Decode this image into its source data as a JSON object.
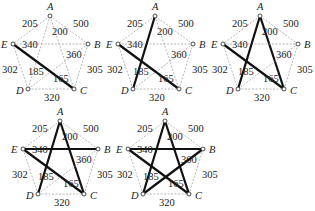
{
  "nodes": {
    "A": {
      "x": 50,
      "y": 16
    },
    "B": {
      "x": 88,
      "y": 44
    },
    "C": {
      "x": 74,
      "y": 89
    },
    "D": {
      "x": 28,
      "y": 89
    },
    "E": {
      "x": 13,
      "y": 44
    }
  },
  "edges": [
    {
      "id": "AE",
      "from": "A",
      "to": "E",
      "weight": "205",
      "lx": 22,
      "ly": 27
    },
    {
      "id": "AB",
      "from": "A",
      "to": "B",
      "weight": "500",
      "lx": 73,
      "ly": 27
    },
    {
      "id": "AC",
      "from": "A",
      "to": "C",
      "weight": "200",
      "lx": 52,
      "ly": 35
    },
    {
      "id": "EB",
      "from": "E",
      "to": "B",
      "weight": "340",
      "lx": 22,
      "ly": 48
    },
    {
      "id": "DB",
      "from": "D",
      "to": "B",
      "weight": "360",
      "lx": 66,
      "ly": 58
    },
    {
      "id": "ED",
      "from": "E",
      "to": "D",
      "weight": "302",
      "lx": 2,
      "ly": 73
    },
    {
      "id": "AD",
      "from": "A",
      "to": "D",
      "weight": "185",
      "lx": 28,
      "ly": 75
    },
    {
      "id": "EC",
      "from": "E",
      "to": "C",
      "weight": "165",
      "lx": 53,
      "ly": 82
    },
    {
      "id": "BC",
      "from": "B",
      "to": "C",
      "weight": "305",
      "lx": 87,
      "ly": 73
    },
    {
      "id": "DC",
      "from": "D",
      "to": "C",
      "weight": "320",
      "lx": 44,
      "ly": 101
    }
  ],
  "panels": [
    {
      "index": 1,
      "x": 0,
      "y": 0,
      "heavy_edges": [
        "EC"
      ]
    },
    {
      "index": 2,
      "x": 105,
      "y": 0,
      "heavy_edges": [
        "EC",
        "AD"
      ]
    },
    {
      "index": 3,
      "x": 210,
      "y": 0,
      "heavy_edges": [
        "EC",
        "AD",
        "AC"
      ]
    },
    {
      "index": 4,
      "x": 10,
      "y": 105,
      "heavy_edges": [
        "EC",
        "AD",
        "AC",
        "EB"
      ]
    },
    {
      "index": 5,
      "x": 115,
      "y": 105,
      "heavy_edges": [
        "EC",
        "AD",
        "AC",
        "EB",
        "DB"
      ]
    }
  ],
  "colors": {
    "heavy": "#111111",
    "light": "#999999",
    "node_fill": "#ffffff"
  }
}
